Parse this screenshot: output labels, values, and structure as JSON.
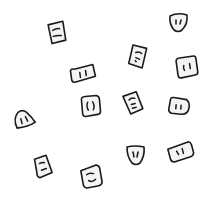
{
  "canvas": {
    "width": 208,
    "height": 199,
    "background": "#ffffff",
    "stroke_color": "#1a1a1a"
  },
  "icons": [
    {
      "name": "outlet-rect-horizontal-slots",
      "shape": "rectangle",
      "x": 57,
      "y": 33,
      "rotation": -6
    },
    {
      "name": "outlet-wide-vertical-slots",
      "shape": "wide-rectangle",
      "x": 83,
      "y": 74,
      "rotation": -8
    },
    {
      "name": "outlet-shield-two-slots",
      "shape": "shield",
      "x": 178,
      "y": 22,
      "rotation": 0
    },
    {
      "name": "outlet-rect-slot-curve",
      "shape": "rectangle",
      "x": 138,
      "y": 57,
      "rotation": 10
    },
    {
      "name": "outlet-square-two-slots",
      "shape": "rounded-square",
      "x": 186,
      "y": 67,
      "rotation": -8
    },
    {
      "name": "outlet-dome-two-slots",
      "shape": "dome",
      "x": 23,
      "y": 119,
      "rotation": -15
    },
    {
      "name": "outlet-square-brackets",
      "shape": "rounded-square",
      "x": 90,
      "y": 105,
      "rotation": -5
    },
    {
      "name": "outlet-rect-horizontal-marks",
      "shape": "rectangle",
      "x": 133,
      "y": 103,
      "rotation": -15
    },
    {
      "name": "outlet-square-two-slots-b",
      "shape": "rounded-square",
      "x": 179,
      "y": 106,
      "rotation": 5
    },
    {
      "name": "outlet-rect-horizontal-slots-b",
      "shape": "rectangle",
      "x": 43,
      "y": 167,
      "rotation": -10
    },
    {
      "name": "outlet-square-smile",
      "shape": "rounded-square",
      "x": 91,
      "y": 176,
      "rotation": -10
    },
    {
      "name": "outlet-shield-v-slots",
      "shape": "shield",
      "x": 135,
      "y": 156,
      "rotation": 0
    },
    {
      "name": "outlet-wide-two-slots",
      "shape": "wide-rectangle",
      "x": 181,
      "y": 152,
      "rotation": -15
    }
  ]
}
